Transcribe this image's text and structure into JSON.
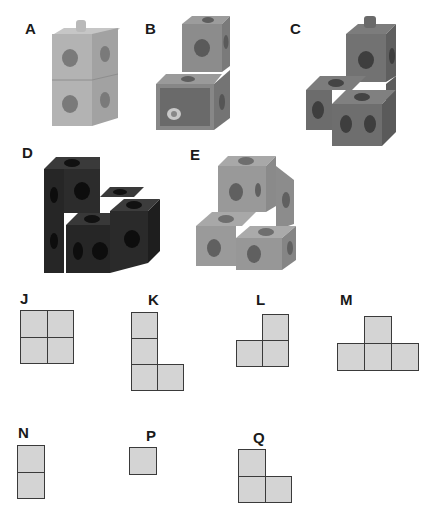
{
  "photos": [
    {
      "id": "A",
      "label": "A",
      "description": "two light-grey linking cubes stacked vertically",
      "cube_count": 2,
      "tone": "#a9a9a9"
    },
    {
      "id": "B",
      "label": "B",
      "description": "two mid-grey linking cubes in an offset step, front open face with peg",
      "cube_count": 2,
      "tone": "#8a8a8a"
    },
    {
      "id": "C",
      "label": "C",
      "description": "three dark-grey linking cubes forming an L",
      "cube_count": 4,
      "tone": "#6f6f6f"
    },
    {
      "id": "D",
      "label": "D",
      "description": "black linking cubes forming a stepped L",
      "cube_count": 5,
      "tone": "#2e2e2e"
    },
    {
      "id": "E",
      "label": "E",
      "description": "light-grey linking cubes forming a stepped L",
      "cube_count": 4,
      "tone": "#9a9a9a"
    }
  ],
  "shapes": [
    {
      "id": "J",
      "label": "J",
      "cells": [
        [
          0,
          0
        ],
        [
          1,
          0
        ],
        [
          0,
          1
        ],
        [
          1,
          1
        ]
      ]
    },
    {
      "id": "K",
      "label": "K",
      "cells": [
        [
          0,
          0
        ],
        [
          0,
          1
        ],
        [
          0,
          2
        ],
        [
          1,
          2
        ]
      ]
    },
    {
      "id": "L",
      "label": "L",
      "cells": [
        [
          1,
          0
        ],
        [
          0,
          1
        ],
        [
          1,
          1
        ]
      ]
    },
    {
      "id": "M",
      "label": "M",
      "cells": [
        [
          1,
          0
        ],
        [
          0,
          1
        ],
        [
          1,
          1
        ],
        [
          2,
          1
        ]
      ]
    },
    {
      "id": "N",
      "label": "N",
      "cells": [
        [
          0,
          0
        ],
        [
          0,
          1
        ]
      ]
    },
    {
      "id": "P",
      "label": "P",
      "cells": [
        [
          0,
          0
        ]
      ]
    },
    {
      "id": "Q",
      "label": "Q",
      "cells": [
        [
          0,
          0
        ],
        [
          0,
          1
        ],
        [
          1,
          1
        ]
      ]
    }
  ],
  "colors": {
    "cell_fill": "#d4d4d4",
    "cell_border": "#3a3a3a",
    "label": "#1a1a1a"
  }
}
